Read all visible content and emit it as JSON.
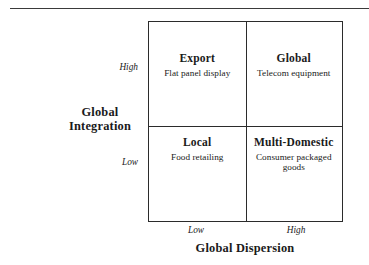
{
  "figure": {
    "type": "2x2-matrix",
    "y_axis": {
      "title_line1": "Global",
      "title_line2": "Integration",
      "tick_high": "High",
      "tick_low": "Low"
    },
    "x_axis": {
      "title": "Global Dispersion",
      "tick_low": "Low",
      "tick_high": "High"
    },
    "quadrants": [
      {
        "position": "top-left",
        "title": "Export",
        "example": "Flat panel display",
        "x_level": "Low",
        "y_level": "High"
      },
      {
        "position": "top-right",
        "title": "Global",
        "example": "Telecom equipment",
        "x_level": "High",
        "y_level": "High"
      },
      {
        "position": "bottom-left",
        "title": "Local",
        "example": "Food retailing",
        "x_level": "Low",
        "y_level": "Low"
      },
      {
        "position": "bottom-right",
        "title": "Multi-Domestic",
        "example": "Consumer packaged goods",
        "x_level": "High",
        "y_level": "Low"
      }
    ],
    "colors": {
      "line": "#2b2b2b",
      "rule": "#3a3a3a",
      "text": "#1a1a1a",
      "background": "#ffffff"
    }
  },
  "chart_data": {
    "type": "table",
    "title": "",
    "xlabel": "Global Dispersion",
    "ylabel": "Global Integration",
    "x_categories": [
      "Low",
      "High"
    ],
    "y_categories": [
      "Low",
      "High"
    ],
    "cells": [
      {
        "x": "Low",
        "y": "High",
        "label": "Export",
        "detail": "Flat panel display"
      },
      {
        "x": "High",
        "y": "High",
        "label": "Global",
        "detail": "Telecom equipment"
      },
      {
        "x": "Low",
        "y": "Low",
        "label": "Local",
        "detail": "Food retailing"
      },
      {
        "x": "High",
        "y": "Low",
        "label": "Multi-Domestic",
        "detail": "Consumer packaged goods"
      }
    ],
    "grid": true,
    "legend": "none"
  }
}
